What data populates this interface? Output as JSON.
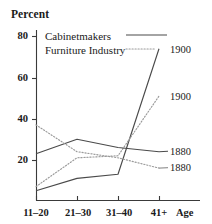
{
  "chart_data": {
    "type": "line",
    "title": "",
    "ylabel": "Percent",
    "xlabel": "Age",
    "categories": [
      "11–20",
      "21–30",
      "31–40",
      "41+"
    ],
    "ylim": [
      0,
      84
    ],
    "yticks": [
      20,
      40,
      60,
      80
    ],
    "ytick_labels": [
      "20",
      "40",
      "60",
      "80"
    ],
    "grid": false,
    "legend_position": "top-left-inside",
    "legend": [
      {
        "name": "Cabinetmakers",
        "style": "solid"
      },
      {
        "name": "Furniture Industry",
        "style": "dotted"
      }
    ],
    "series": [
      {
        "name": "Cabinetmakers 1900",
        "group": "Cabinetmakers",
        "year": "1900",
        "style": "solid",
        "end_label": "1900",
        "values": [
          5,
          11,
          13,
          74
        ]
      },
      {
        "name": "Furniture Industry 1900",
        "group": "Furniture Industry",
        "year": "1900",
        "style": "dotted",
        "end_label": "1900",
        "values": [
          7,
          21,
          22,
          51
        ]
      },
      {
        "name": "Cabinetmakers 1880",
        "group": "Cabinetmakers",
        "year": "1880",
        "style": "solid",
        "end_label": "1880",
        "values": [
          23,
          30,
          26,
          24
        ]
      },
      {
        "name": "Furniture Industry 1880",
        "group": "Furniture Industry",
        "year": "1880",
        "style": "dotted",
        "end_label": "1880",
        "values": [
          37,
          24,
          21,
          16
        ]
      }
    ]
  },
  "axis": {
    "y_title": "Percent",
    "x_title": "Age",
    "y_tick_0": "80",
    "y_tick_1": "60",
    "y_tick_2": "40",
    "y_tick_3": "20",
    "x_tick_0": "11–20",
    "x_tick_1": "21–30",
    "x_tick_2": "31–40",
    "x_tick_3": "41+"
  },
  "legend": {
    "cabinetmakers": "Cabinetmakers",
    "furniture_industry": "Furniture Industry"
  },
  "end_labels": {
    "cab_1900": "1900",
    "fur_1900": "1900",
    "cab_1880": "1880",
    "fur_1880": "1880"
  },
  "colors": {
    "ink": "#1a1a1a",
    "line": "#4a4a4a",
    "dotted": "#8a8a8a",
    "background": "#ffffff"
  }
}
